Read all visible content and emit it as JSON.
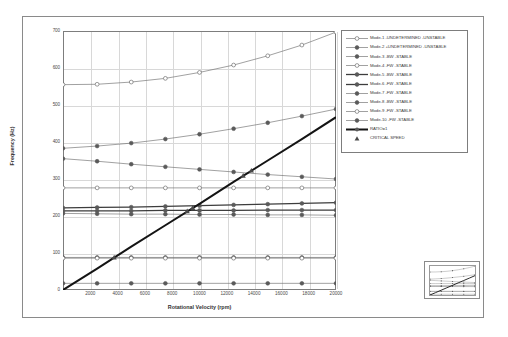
{
  "chart_data": {
    "type": "line",
    "title": "",
    "xlabel": "Rotational Velocity (rpm)",
    "ylabel": "Frequency (Hz)",
    "xlim": [
      0,
      20000
    ],
    "ylim": [
      0,
      700
    ],
    "grid": true,
    "legend_position": "top-right",
    "xticks": [
      2000,
      4000,
      6000,
      8000,
      10000,
      12000,
      14000,
      16000,
      18000,
      20000
    ],
    "yticks": [
      700,
      600,
      500,
      400,
      300,
      200,
      100,
      0
    ],
    "x": [
      0,
      2500,
      5000,
      7500,
      10000,
      12500,
      15000,
      17500,
      20000
    ],
    "series": [
      {
        "name": "Mode-1 -UNDETERMINED -UNSTABLE",
        "marker": "open-circle",
        "width": "thin",
        "values": [
          555,
          556,
          562,
          572,
          588,
          608,
          633,
          662,
          697
        ]
      },
      {
        "name": "Mode-2 +UNDETERMINED -UNSTABLE",
        "marker": "filled-circle",
        "width": "thin",
        "values": [
          383,
          389,
          397,
          408,
          421,
          436,
          452,
          470,
          489
        ]
      },
      {
        "name": "Mode-3 -BW -STABLE",
        "marker": "filled-circle",
        "width": "thin",
        "values": [
          355,
          348,
          340,
          333,
          326,
          319,
          312,
          306,
          300
        ]
      },
      {
        "name": "Mode-4 -FW -STABLE",
        "marker": "open-circle",
        "width": "thin",
        "values": [
          276,
          276,
          276,
          276,
          276,
          276,
          276,
          276,
          276
        ]
      },
      {
        "name": "Mode-5 -BW -STABLE",
        "marker": "filled-circle",
        "width": "thick",
        "values": [
          222,
          223,
          224,
          226,
          228,
          230,
          232,
          234,
          236
        ]
      },
      {
        "name": "Mode-6 -FW -STABLE",
        "marker": "filled-circle",
        "width": "thick",
        "values": [
          214,
          214,
          214,
          215,
          215,
          215,
          216,
          216,
          216
        ]
      },
      {
        "name": "Mode-7 -FW -STABLE",
        "marker": "filled-circle",
        "width": "thin",
        "values": [
          207,
          206,
          205,
          205,
          204,
          204,
          203,
          203,
          202
        ]
      },
      {
        "name": "Mode-8 -BW -STABLE",
        "marker": "filled-circle",
        "width": "thin",
        "values": [
          88,
          88,
          88,
          88,
          88,
          88,
          88,
          88,
          88
        ]
      },
      {
        "name": "Mode-9 -FW -STABLE",
        "marker": "open-circle",
        "width": "thin",
        "values": [
          86,
          86,
          86,
          86,
          86,
          86,
          86,
          86,
          86
        ]
      },
      {
        "name": "Mode-10 -FW -STABLE",
        "marker": "filled-circle",
        "width": "thin",
        "values": [
          18,
          18,
          18,
          18,
          18,
          18,
          18,
          18,
          18
        ]
      },
      {
        "name": "RATIO=1",
        "marker": "none",
        "width": "heavy",
        "values": [
          0,
          58,
          117,
          175,
          233,
          292,
          350,
          408,
          467
        ]
      }
    ],
    "critical_speeds": [
      {
        "rpm": 3750,
        "hz": 88
      },
      {
        "rpm": 9100,
        "hz": 213
      },
      {
        "rpm": 9500,
        "hz": 222
      },
      {
        "rpm": 13200,
        "hz": 309
      },
      {
        "rpm": 13800,
        "hz": 323
      }
    ],
    "annotations": []
  },
  "legend": {
    "entries": [
      {
        "label": "Mode-1 -UNDETERMINED -UNSTABLE",
        "key": "open-circle-thin"
      },
      {
        "label": "Mode-2 +UNDETERMINED -UNSTABLE",
        "key": "filled-circle-thin"
      },
      {
        "label": "Mode-3 -BW -STABLE",
        "key": "filled-circle-thin"
      },
      {
        "label": "Mode-4 -FW -STABLE",
        "key": "open-circle-thin"
      },
      {
        "label": "Mode-5 -BW -STABLE",
        "key": "filled-circle-thick"
      },
      {
        "label": "Mode-6 -FW -STABLE",
        "key": "filled-circle-thick"
      },
      {
        "label": "Mode-7 -FW -STABLE",
        "key": "filled-circle-thin"
      },
      {
        "label": "Mode-8 -BW -STABLE",
        "key": "filled-circle-thin"
      },
      {
        "label": "Mode-9 -FW -STABLE",
        "key": "open-circle-thin"
      },
      {
        "label": "Mode-10 -FW -STABLE",
        "key": "filled-circle-thin"
      },
      {
        "label": "RATIO=1",
        "key": "line-heavy"
      },
      {
        "label": "CRITICAL SPEED",
        "key": "triangle-marker"
      }
    ]
  },
  "colors": {
    "frame": "#8a8a8a",
    "axis": "#7d7d7d",
    "grid": "#d8d8d8",
    "curve": "#6e6e6e",
    "curve_dark": "#3d3d3d",
    "ratio_line": "#141414",
    "marker": "#5a5a5a",
    "text": "#3a3a3a"
  }
}
